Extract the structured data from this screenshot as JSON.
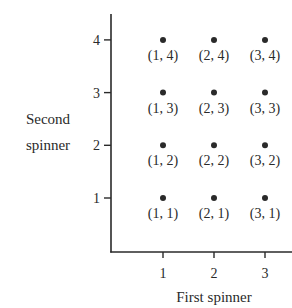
{
  "chart_data": {
    "type": "scatter",
    "title": "",
    "xlabel": "First spinner",
    "ylabel_lines": [
      "Second",
      "spinner"
    ],
    "ylabel": "Second spinner",
    "x_ticks": [
      "1",
      "2",
      "3"
    ],
    "y_ticks": [
      "1",
      "2",
      "3",
      "4"
    ],
    "xlim": [
      0,
      3.5
    ],
    "ylim": [
      0,
      4.5
    ],
    "grid": false,
    "points": [
      {
        "x": 1,
        "y": 4,
        "label": "(1, 4)"
      },
      {
        "x": 2,
        "y": 4,
        "label": "(2, 4)"
      },
      {
        "x": 3,
        "y": 4,
        "label": "(3, 4)"
      },
      {
        "x": 1,
        "y": 3,
        "label": "(1, 3)"
      },
      {
        "x": 2,
        "y": 3,
        "label": "(2, 3)"
      },
      {
        "x": 3,
        "y": 3,
        "label": "(3, 3)"
      },
      {
        "x": 1,
        "y": 2,
        "label": "(1, 2)"
      },
      {
        "x": 2,
        "y": 2,
        "label": "(2, 2)"
      },
      {
        "x": 3,
        "y": 2,
        "label": "(3, 2)"
      },
      {
        "x": 1,
        "y": 1,
        "label": "(1, 1)"
      },
      {
        "x": 2,
        "y": 1,
        "label": "(2, 1)"
      },
      {
        "x": 3,
        "y": 1,
        "label": "(3, 1)"
      }
    ]
  },
  "colors": {
    "ink": "#2a2a2a",
    "background": "#ffffff"
  }
}
